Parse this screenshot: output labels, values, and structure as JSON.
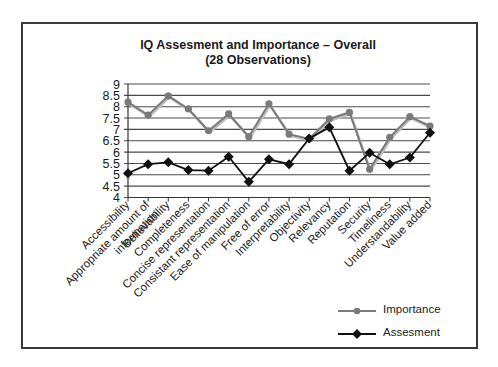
{
  "chart_data": {
    "type": "line",
    "title": "IQ Assesment and Importance – Overall",
    "subtitle": "(28 Observations)",
    "xlabel": "",
    "ylabel": "",
    "ylim": [
      4,
      9
    ],
    "yticks": [
      "4",
      "4.5",
      "5",
      "5.5",
      "6",
      "6.5",
      "7",
      "7.5",
      "8",
      "8.5",
      "9"
    ],
    "grid": true,
    "legend_position": "bottom-right",
    "categories": [
      "Accessibility",
      "Appropriate amount of information",
      "Believability",
      "Completeness",
      "Concise representation",
      "Consistant representation",
      "Ease of manipulation",
      "Free of error",
      "Interpretability",
      "Objectivity",
      "Relevancy",
      "Reputation",
      "Security",
      "Timeliness",
      "Understandability",
      "Value added"
    ],
    "category_label_lines": [
      [
        "Accessibility"
      ],
      [
        "Appropriate amount of",
        "information"
      ],
      [
        "Believability"
      ],
      [
        "Completeness"
      ],
      [
        "Concise representation"
      ],
      [
        "Consistant representation"
      ],
      [
        "Ease of manipulation"
      ],
      [
        "Free of error"
      ],
      [
        "Interpretability"
      ],
      [
        "Objectivity"
      ],
      [
        "Relevancy"
      ],
      [
        "Reputation"
      ],
      [
        "Security"
      ],
      [
        "Timeliness"
      ],
      [
        "Understandability"
      ],
      [
        "Value added"
      ]
    ],
    "series": [
      {
        "name": "Importance",
        "color": "#7a7a7a",
        "marker": "circle",
        "values": [
          8.2,
          7.63,
          8.48,
          7.9,
          6.94,
          7.68,
          6.68,
          8.13,
          6.79,
          6.58,
          7.46,
          7.75,
          5.24,
          6.65,
          7.56,
          7.15
        ]
      },
      {
        "name": "Assesment",
        "color": "#111111",
        "marker": "diamond",
        "values": [
          5.07,
          5.47,
          5.55,
          5.21,
          5.18,
          5.8,
          4.69,
          5.68,
          5.47,
          6.6,
          7.09,
          5.18,
          5.97,
          5.46,
          5.76,
          6.85
        ]
      }
    ]
  },
  "legend": {
    "items": [
      {
        "label": "Importance"
      },
      {
        "label": "Assesment"
      }
    ]
  }
}
